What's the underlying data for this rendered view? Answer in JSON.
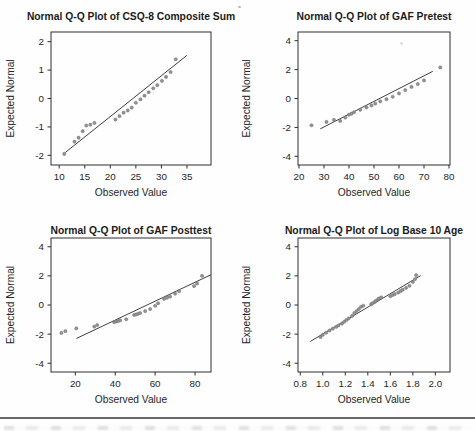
{
  "page": {
    "background": "#fefefe",
    "footer_rule_color": "#4f4f4f"
  },
  "styles": {
    "frame_color": "#2e2e2e",
    "tick_color": "#2e2e2e",
    "point_fill": "#939393",
    "point_stroke": "#6f6f6f",
    "line_color": "#3f3f3f",
    "title_color": "#1b1b1b",
    "label_color": "#262626"
  },
  "chart_data": [
    {
      "id": "csq8-composite-sum",
      "type": "scatter",
      "title": "Normal Q-Q Plot of CSQ-8 Composite Sum",
      "xlabel": "Observed Value",
      "ylabel": "Expected Normal",
      "xlim": [
        8.4,
        39.7
      ],
      "ylim": [
        -2.34,
        2.34
      ],
      "grid": false,
      "x_ticks": [
        {
          "v": 10,
          "label": "10"
        },
        {
          "v": 15,
          "label": "15"
        },
        {
          "v": 20,
          "label": "20"
        },
        {
          "v": 25,
          "label": "25"
        },
        {
          "v": 30,
          "label": "30"
        },
        {
          "v": 35,
          "label": "35"
        }
      ],
      "y_ticks": [
        {
          "v": -2,
          "label": "-2"
        },
        {
          "v": -1,
          "label": "-1"
        },
        {
          "v": 0,
          "label": "0"
        },
        {
          "v": 1,
          "label": "1"
        },
        {
          "v": 2,
          "label": "2"
        }
      ],
      "points": [
        [
          11,
          -1.95
        ],
        [
          13,
          -1.52
        ],
        [
          13.8,
          -1.38
        ],
        [
          14.6,
          -1.15
        ],
        [
          15.3,
          -0.95
        ],
        [
          16.1,
          -0.92
        ],
        [
          16.9,
          -0.86
        ],
        [
          21,
          -0.74
        ],
        [
          21.8,
          -0.62
        ],
        [
          22.6,
          -0.5
        ],
        [
          23.4,
          -0.42
        ],
        [
          24.2,
          -0.32
        ],
        [
          25,
          -0.15
        ],
        [
          25.9,
          -0.03
        ],
        [
          26.7,
          0.1
        ],
        [
          27.5,
          0.22
        ],
        [
          28.4,
          0.36
        ],
        [
          29.2,
          0.47
        ],
        [
          30.1,
          0.62
        ],
        [
          30.9,
          0.76
        ],
        [
          31.8,
          0.93
        ],
        [
          32.8,
          1.38
        ]
      ],
      "fit_line": {
        "x1": 11.2,
        "y1": -1.9,
        "x2": 35.0,
        "y2": 1.52
      }
    },
    {
      "id": "gaf-pretest",
      "type": "scatter",
      "title": "Normal Q-Q Plot of GAF Pretest",
      "xlabel": "Observed Value",
      "ylabel": "Expected Normal",
      "xlim": [
        19.6,
        80.4
      ],
      "ylim": [
        -4.6,
        4.6
      ],
      "grid": false,
      "x_ticks": [
        {
          "v": 20,
          "label": "20"
        },
        {
          "v": 30,
          "label": "30"
        },
        {
          "v": 40,
          "label": "40"
        },
        {
          "v": 50,
          "label": "50"
        },
        {
          "v": 60,
          "label": "60"
        },
        {
          "v": 70,
          "label": "70"
        },
        {
          "v": 80,
          "label": "80"
        }
      ],
      "y_ticks": [
        {
          "v": -4,
          "label": "-4"
        },
        {
          "v": -2,
          "label": "-2"
        },
        {
          "v": 0,
          "label": "0"
        },
        {
          "v": 2,
          "label": "2"
        },
        {
          "v": 4,
          "label": "4"
        }
      ],
      "points": [
        [
          25,
          -1.85
        ],
        [
          31,
          -1.62
        ],
        [
          34,
          -1.48
        ],
        [
          36.5,
          -1.55
        ],
        [
          38.5,
          -1.32
        ],
        [
          40,
          -1.12
        ],
        [
          41,
          -1.05
        ],
        [
          42,
          -0.95
        ],
        [
          44.5,
          -0.78
        ],
        [
          47,
          -0.62
        ],
        [
          49,
          -0.48
        ],
        [
          50.5,
          -0.35
        ],
        [
          52.5,
          -0.2
        ],
        [
          55,
          -0.05
        ],
        [
          57.5,
          0.12
        ],
        [
          60,
          0.35
        ],
        [
          62.5,
          0.58
        ],
        [
          65,
          0.8
        ],
        [
          67.5,
          1.0
        ],
        [
          70,
          1.25
        ],
        [
          76.5,
          2.15
        ]
      ],
      "stray_mark": [
        61,
        3.8
      ],
      "fit_line": {
        "x1": 28.5,
        "y1": -2.1,
        "x2": 73.5,
        "y2": 1.88
      }
    },
    {
      "id": "gaf-posttest",
      "type": "scatter",
      "title": "Normal Q-Q Plot of GAF Posttest",
      "xlabel": "Observed Value",
      "ylabel": "Expected Normal",
      "xlim": [
        7.8,
        88.0
      ],
      "ylim": [
        -4.6,
        4.6
      ],
      "grid": false,
      "x_ticks": [
        {
          "v": 20,
          "label": "20"
        },
        {
          "v": 40,
          "label": "40"
        },
        {
          "v": 60,
          "label": "60"
        },
        {
          "v": 80,
          "label": "80"
        }
      ],
      "y_ticks": [
        {
          "v": -4,
          "label": "-4"
        },
        {
          "v": -2,
          "label": "-2"
        },
        {
          "v": 0,
          "label": "0"
        },
        {
          "v": 2,
          "label": "2"
        },
        {
          "v": 4,
          "label": "4"
        }
      ],
      "points": [
        [
          13,
          -1.92
        ],
        [
          15,
          -1.8
        ],
        [
          20.5,
          -1.6
        ],
        [
          29.5,
          -1.48
        ],
        [
          31,
          -1.38
        ],
        [
          39.5,
          -1.18
        ],
        [
          40.5,
          -1.12
        ],
        [
          41.5,
          -1.1
        ],
        [
          42.5,
          -1.05
        ],
        [
          45.5,
          -0.98
        ],
        [
          49.5,
          -0.68
        ],
        [
          50.5,
          -0.65
        ],
        [
          51.5,
          -0.6
        ],
        [
          52.5,
          -0.55
        ],
        [
          55,
          -0.42
        ],
        [
          57.5,
          -0.28
        ],
        [
          60,
          -0.05
        ],
        [
          61.5,
          0.12
        ],
        [
          64.5,
          0.42
        ],
        [
          66,
          0.5
        ],
        [
          67.5,
          0.58
        ],
        [
          70,
          0.78
        ],
        [
          72,
          0.95
        ],
        [
          79.5,
          1.3
        ],
        [
          81,
          1.48
        ],
        [
          83.5,
          2.0
        ]
      ],
      "fit_line": {
        "x1": 20.5,
        "y1": -2.3,
        "x2": 88,
        "y2": 2.08
      }
    },
    {
      "id": "log-base-10-age",
      "type": "scatter",
      "title": "Normal Q-Q Plot of Log Base 10 Age",
      "xlabel": "Observed Value",
      "ylabel": "Expected Normal",
      "xlim": [
        0.78,
        2.13
      ],
      "ylim": [
        -4.6,
        4.6
      ],
      "grid": false,
      "x_ticks": [
        {
          "v": 0.8,
          "label": "0.8"
        },
        {
          "v": 1.0,
          "label": "1.0"
        },
        {
          "v": 1.2,
          "label": "1.2"
        },
        {
          "v": 1.4,
          "label": "1.4"
        },
        {
          "v": 1.6,
          "label": "1.6"
        },
        {
          "v": 1.8,
          "label": "1.8"
        },
        {
          "v": 2.0,
          "label": "2.0"
        }
      ],
      "y_ticks": [
        {
          "v": -4,
          "label": "-4"
        },
        {
          "v": -2,
          "label": "-2"
        },
        {
          "v": 0,
          "label": "0"
        },
        {
          "v": 2,
          "label": "2"
        },
        {
          "v": 4,
          "label": "4"
        }
      ],
      "points": [
        [
          0.98,
          -2.2
        ],
        [
          1.0,
          -2.05
        ],
        [
          1.03,
          -1.9
        ],
        [
          1.06,
          -1.75
        ],
        [
          1.09,
          -1.62
        ],
        [
          1.12,
          -1.5
        ],
        [
          1.14,
          -1.4
        ],
        [
          1.17,
          -1.28
        ],
        [
          1.19,
          -1.15
        ],
        [
          1.21,
          -1.03
        ],
        [
          1.23,
          -0.92
        ],
        [
          1.26,
          -0.75
        ],
        [
          1.28,
          -0.55
        ],
        [
          1.3,
          -0.42
        ],
        [
          1.32,
          -0.28
        ],
        [
          1.34,
          -0.12
        ],
        [
          1.36,
          -0.05
        ],
        [
          1.43,
          0.05
        ],
        [
          1.44,
          0.12
        ],
        [
          1.46,
          0.2
        ],
        [
          1.47,
          0.28
        ],
        [
          1.49,
          0.38
        ],
        [
          1.5,
          0.45
        ],
        [
          1.52,
          0.52
        ],
        [
          1.6,
          0.6
        ],
        [
          1.62,
          0.68
        ],
        [
          1.64,
          0.75
        ],
        [
          1.67,
          0.85
        ],
        [
          1.69,
          0.95
        ],
        [
          1.71,
          1.05
        ],
        [
          1.74,
          1.18
        ],
        [
          1.77,
          1.32
        ],
        [
          1.8,
          1.58
        ],
        [
          1.82,
          1.78
        ],
        [
          1.83,
          2.05
        ]
      ],
      "fit_line": {
        "x1": 0.89,
        "y1": -2.5,
        "x2": 1.87,
        "y2": 2.02
      }
    }
  ]
}
